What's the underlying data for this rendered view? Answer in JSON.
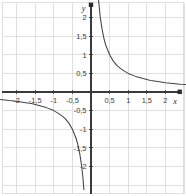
{
  "figure": {
    "title": "",
    "background_color": "#ffffff",
    "width": 186,
    "height": 196
  },
  "axes": {
    "x_axis_label": "x",
    "y_axis_label": "y",
    "axis_color": "#333333",
    "grid_color": "#d6d6d6",
    "curve_color": "#444444",
    "origin": {
      "x": 91,
      "y": 92
    },
    "pixels_per_unit": 37.2,
    "x_tick_labels": [
      "-2",
      "-1,5",
      "-1",
      "-0,5",
      "0,5",
      "1",
      "1,5",
      "2"
    ],
    "x_tick_values": [
      -2,
      -1.5,
      -1,
      -0.5,
      0.5,
      1,
      1.5,
      2
    ],
    "y_tick_labels": [
      "2",
      "1,5",
      "1",
      "0,5",
      "-0,5",
      "-1",
      "-1,5",
      "-2"
    ],
    "y_tick_values": [
      2,
      1.5,
      1,
      0.5,
      -0.5,
      -1,
      -1.5,
      -2
    ]
  },
  "chart_data": {
    "type": "line",
    "title": "",
    "xlabel": "x",
    "ylabel": "y",
    "xlim": [
      -2.44,
      2.55
    ],
    "ylim": [
      -2.78,
      2.47
    ],
    "grid": true,
    "grid_step": 0.5,
    "legend": "none",
    "function": "y = 1/(2x)",
    "series": [
      {
        "name": "branch-positive",
        "x": [
          0.2,
          0.25,
          0.3,
          0.35,
          0.4,
          0.5,
          0.6,
          0.7,
          0.8,
          0.9,
          1.0,
          1.2,
          1.4,
          1.6,
          1.8,
          2.0,
          2.2,
          2.4,
          2.55
        ],
        "y": [
          2.5,
          2.0,
          1.67,
          1.43,
          1.25,
          1.0,
          0.83,
          0.71,
          0.63,
          0.56,
          0.5,
          0.42,
          0.36,
          0.31,
          0.28,
          0.25,
          0.23,
          0.21,
          0.2
        ]
      },
      {
        "name": "branch-negative",
        "x": [
          -2.44,
          -2.2,
          -2.0,
          -1.8,
          -1.6,
          -1.4,
          -1.2,
          -1.0,
          -0.9,
          -0.8,
          -0.7,
          -0.6,
          -0.5,
          -0.4,
          -0.35,
          -0.3,
          -0.25,
          -0.22,
          -0.19
        ],
        "y": [
          -0.2,
          -0.23,
          -0.25,
          -0.28,
          -0.31,
          -0.36,
          -0.42,
          -0.5,
          -0.56,
          -0.63,
          -0.71,
          -0.83,
          -1.0,
          -1.25,
          -1.43,
          -1.67,
          -2.0,
          -2.27,
          -2.63
        ]
      }
    ]
  }
}
